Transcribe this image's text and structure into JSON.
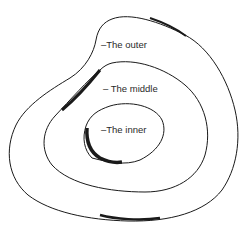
{
  "diagram": {
    "type": "nested-closed-curves",
    "labels": {
      "outer": "–The outer",
      "middle": "– The middle",
      "inner": "–The inner"
    },
    "colors": {
      "stroke": "#1a1a1a",
      "text": "#2a2a2a",
      "background": "#ffffff"
    }
  }
}
